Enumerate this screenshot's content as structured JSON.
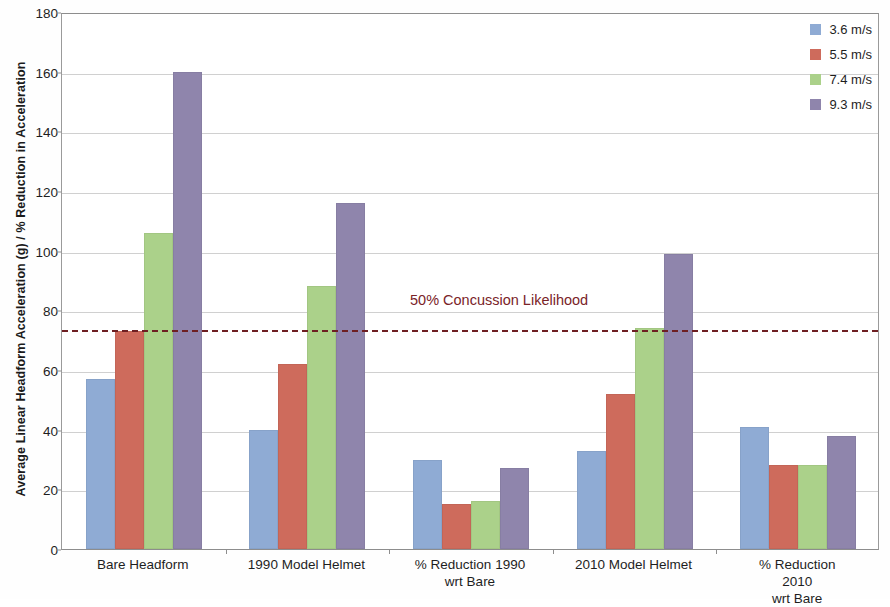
{
  "chart_data": {
    "type": "bar",
    "title": "",
    "xlabel": "",
    "ylabel": "Average Linear Headform Acceleration (g) / % Reduction in Acceleration",
    "ylim": [
      0,
      180
    ],
    "ytick_step": 20,
    "yticks": [
      0,
      20,
      40,
      60,
      80,
      100,
      120,
      140,
      160,
      180
    ],
    "grid": true,
    "legend_position": "top-right",
    "categories": [
      "Bare Headform",
      "1990 Model Helmet",
      "% Reduction 1990\nwrt Bare",
      "2010 Model Helmet",
      "% Reduction 2010\nwrt Bare"
    ],
    "series": [
      {
        "name": "3.6 m/s",
        "color": "#8fabd4",
        "values": [
          57,
          40,
          30,
          33,
          41
        ]
      },
      {
        "name": "5.5 m/s",
        "color": "#ce6b5c",
        "values": [
          73,
          62,
          15,
          52,
          28
        ]
      },
      {
        "name": "7.4 m/s",
        "color": "#abd18a",
        "values": [
          106,
          88,
          16,
          74,
          28
        ]
      },
      {
        "name": "9.3 m/s",
        "color": "#8f85ac",
        "values": [
          160,
          116,
          27,
          99,
          38
        ]
      }
    ],
    "annotations": [
      {
        "name": "concussion-threshold",
        "label": "50% Concussion Likelihood",
        "value": 74,
        "style": "dashed",
        "color": "#6e1f22",
        "label_color": "#7a2328"
      }
    ]
  }
}
